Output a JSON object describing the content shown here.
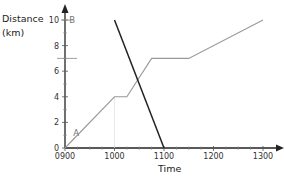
{
  "chart_data": {
    "type": "line",
    "title": "",
    "xlabel": "Time",
    "ylabel": "Distance (km)",
    "ylabel_lines": [
      "Distance",
      "(km)"
    ],
    "x_ticks": [
      "0900",
      "1000",
      "1100",
      "1200",
      "1300"
    ],
    "y_ticks": [
      "0",
      "2",
      "4",
      "6",
      "8",
      "10"
    ],
    "xlim": [
      "0900",
      "1320"
    ],
    "ylim": [
      0,
      11
    ],
    "grid": false,
    "legend": null,
    "annotations": [
      {
        "text": "A",
        "x": "0910",
        "y": 1.2
      },
      {
        "text": "B",
        "x": "0905",
        "y": 10
      }
    ],
    "series": [
      {
        "name": "Journey from A to B",
        "color": "#999999",
        "points": [
          {
            "time": "0900",
            "distance": 0
          },
          {
            "time": "1000",
            "distance": 4
          },
          {
            "time": "1015",
            "distance": 4
          },
          {
            "time": "1045",
            "distance": 7
          },
          {
            "time": "1130",
            "distance": 7
          },
          {
            "time": "1300",
            "distance": 10
          }
        ]
      },
      {
        "name": "Journey from B to A",
        "color": "#222222",
        "points": [
          {
            "time": "1000",
            "distance": 10
          },
          {
            "time": "1100",
            "distance": 0
          }
        ]
      }
    ]
  }
}
